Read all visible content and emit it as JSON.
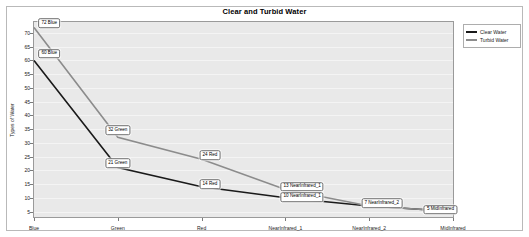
{
  "chart_data": {
    "type": "line",
    "title": "Clear and Turbid Water",
    "xlabel": "",
    "ylabel": "Types of Water",
    "categories": [
      "Blue",
      "Green",
      "Red",
      "NearInfrared_1",
      "NearInfrared_2",
      "MidInfrared"
    ],
    "series": [
      {
        "name": "Clear Water",
        "color": "#1a1a1a",
        "values": [
          60,
          21,
          14,
          10,
          7,
          5
        ],
        "labels": [
          "60 Blue",
          "21 Green",
          "14 Red",
          "10 NearInfrared_1",
          "7 NearInfrared_2",
          "5 MidInfrared"
        ]
      },
      {
        "name": "Turbid Water",
        "color": "#8c8c8c",
        "values": [
          72,
          32,
          24,
          13,
          7,
          5
        ],
        "labels": [
          "72 Blue",
          "32 Green",
          "24 Red",
          "13 NearInfrared_1",
          "7 NearInfrared_2",
          "5 MidInfrared"
        ]
      }
    ],
    "yticks": [
      5,
      10,
      15,
      20,
      25,
      30,
      35,
      40,
      45,
      50,
      55,
      60,
      65,
      70
    ],
    "ylim": [
      3,
      74
    ],
    "grid": true,
    "legend_position": "right-outside",
    "plot_background": "#e9e9e9"
  },
  "legend": {
    "entries": [
      {
        "label": "Clear Water",
        "color": "#1a1a1a"
      },
      {
        "label": "Turbid Water",
        "color": "#8c8c8c"
      }
    ]
  },
  "visible_data_labels": [
    {
      "text": "72 Blue",
      "x_pct": 2.0,
      "y_val": 73.5,
      "anchor": "tl"
    },
    {
      "text": "60 Blue",
      "x_pct": 2.0,
      "y_val": 62.5,
      "anchor": "tl"
    },
    {
      "text": "32 Green",
      "x_pct": 20.0,
      "y_val": 34.5,
      "anchor": "c"
    },
    {
      "text": "21 Green",
      "x_pct": 20.0,
      "y_val": 22.5,
      "anchor": "c"
    },
    {
      "text": "24 Red",
      "x_pct": 42.0,
      "y_val": 25.5,
      "anchor": "c"
    },
    {
      "text": "14 Red",
      "x_pct": 42.0,
      "y_val": 15.0,
      "anchor": "c"
    },
    {
      "text": "13 NearInfrared_1",
      "x_pct": 64.0,
      "y_val": 14.0,
      "anchor": "c"
    },
    {
      "text": "10 NearInfrared_1",
      "x_pct": 64.0,
      "y_val": 10.3,
      "anchor": "c"
    },
    {
      "text": "7 NearInfrared_2",
      "x_pct": 83.0,
      "y_val": 8.0,
      "anchor": "c"
    },
    {
      "text": "5 MidInfrared",
      "x_pct": 97.0,
      "y_val": 5.6,
      "anchor": "c"
    }
  ]
}
